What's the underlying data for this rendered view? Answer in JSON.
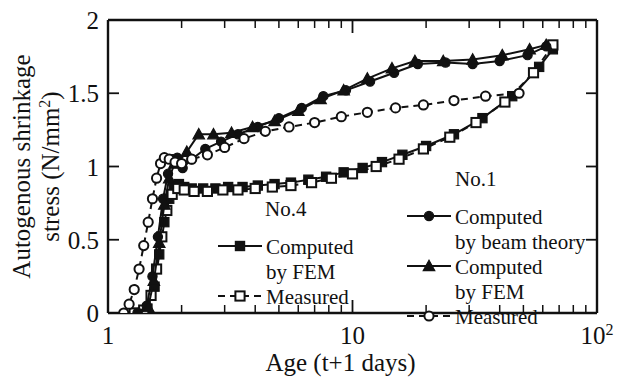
{
  "chart_data": {
    "type": "line",
    "title": "",
    "xlabel": "Age (t+1 days)",
    "ylabel_line1": "Autogenous shrinkage",
    "ylabel_line2": "stress (N/mm",
    "ylabel_sup": "2",
    "ylabel_close": ")",
    "xscale": "log",
    "yscale": "linear",
    "xlim": [
      1,
      100
    ],
    "ylim": [
      0,
      2
    ],
    "xticks": [
      1,
      10,
      100
    ],
    "xticklabels": [
      "1",
      "10",
      "10²"
    ],
    "xtick_superscripts": [
      "",
      "",
      "2"
    ],
    "yticks": [
      0,
      0.5,
      1,
      1.5,
      2
    ],
    "yticklabels": [
      "0",
      "0.5",
      "1",
      "1.5",
      "2"
    ],
    "grid": false,
    "legend_position": "inside-lower-right",
    "series": [
      {
        "name": "No.4 Computed by FEM",
        "group": "No.4",
        "marker": "square-filled",
        "line": "solid",
        "x": [
          1.3,
          1.45,
          1.55,
          1.62,
          1.7,
          1.78,
          1.86,
          1.95,
          2.05,
          2.2,
          2.45,
          2.75,
          3.1,
          3.55,
          4.1,
          4.8,
          5.6,
          6.6,
          7.8,
          9.2,
          11.0,
          13.2,
          16.0,
          20.0,
          26.0,
          34.0,
          45.0,
          58.0,
          66.0
        ],
        "y": [
          0.0,
          0.03,
          0.18,
          0.4,
          0.62,
          0.78,
          0.86,
          0.88,
          0.86,
          0.85,
          0.85,
          0.85,
          0.86,
          0.86,
          0.87,
          0.88,
          0.89,
          0.91,
          0.93,
          0.96,
          0.99,
          1.03,
          1.08,
          1.14,
          1.22,
          1.33,
          1.48,
          1.68,
          1.8
        ]
      },
      {
        "name": "No.4 Measured",
        "group": "No.4",
        "marker": "square-open",
        "line": "dashed",
        "x": [
          1.28,
          1.4,
          1.5,
          1.58,
          1.66,
          1.74,
          1.83,
          1.93,
          2.05,
          2.25,
          2.55,
          2.95,
          3.4,
          4.0,
          4.7,
          5.6,
          6.8,
          8.2,
          10.0,
          12.5,
          15.5,
          19.5,
          25.0,
          32.0,
          42.0,
          55.0,
          66.0
        ],
        "y": [
          0.0,
          0.02,
          0.12,
          0.3,
          0.52,
          0.7,
          0.81,
          0.85,
          0.84,
          0.83,
          0.83,
          0.84,
          0.84,
          0.85,
          0.86,
          0.87,
          0.89,
          0.92,
          0.95,
          1.0,
          1.05,
          1.12,
          1.2,
          1.3,
          1.44,
          1.64,
          1.83
        ]
      },
      {
        "name": "No.1 Computed by beam theory",
        "group": "No.1",
        "marker": "circle-filled",
        "line": "solid",
        "x": [
          1.32,
          1.44,
          1.52,
          1.6,
          1.68,
          1.76,
          1.84,
          1.92,
          2.02,
          2.2,
          2.5,
          2.9,
          3.4,
          4.1,
          5.0,
          6.2,
          7.6,
          9.4,
          11.8,
          14.8,
          18.5,
          24.0,
          31.0,
          40.0,
          52.0,
          62.0
        ],
        "y": [
          0.0,
          0.05,
          0.25,
          0.52,
          0.78,
          0.95,
          1.05,
          1.06,
          0.99,
          1.05,
          1.12,
          1.17,
          1.22,
          1.27,
          1.33,
          1.4,
          1.48,
          1.52,
          1.58,
          1.64,
          1.7,
          1.71,
          1.7,
          1.72,
          1.76,
          1.82
        ]
      },
      {
        "name": "No.1 Computed by FEM",
        "group": "No.1",
        "marker": "triangle-filled",
        "line": "solid",
        "x": [
          1.34,
          1.46,
          1.54,
          1.62,
          1.7,
          1.78,
          1.87,
          1.96,
          2.1,
          2.35,
          2.7,
          3.2,
          3.9,
          4.8,
          6.0,
          7.4,
          9.2,
          11.5,
          14.5,
          18.0,
          23.5,
          31.0,
          41.0,
          53.0,
          62.0
        ],
        "y": [
          0.0,
          0.04,
          0.22,
          0.48,
          0.74,
          0.92,
          1.02,
          1.04,
          1.1,
          1.22,
          1.22,
          1.23,
          1.27,
          1.31,
          1.38,
          1.46,
          1.52,
          1.6,
          1.67,
          1.72,
          1.72,
          1.73,
          1.76,
          1.8,
          1.83
        ]
      },
      {
        "name": "No.1 Measured",
        "group": "No.1",
        "marker": "circle-open",
        "line": "dashed",
        "x": [
          1.16,
          1.22,
          1.28,
          1.34,
          1.4,
          1.46,
          1.52,
          1.58,
          1.64,
          1.7,
          1.78,
          1.88,
          2.0,
          2.2,
          2.55,
          3.0,
          3.6,
          4.4,
          5.5,
          7.0,
          9.0,
          11.5,
          15.0,
          19.5,
          26.0,
          35.0,
          48.0
        ],
        "y": [
          0.0,
          0.06,
          0.16,
          0.3,
          0.46,
          0.62,
          0.78,
          0.92,
          1.02,
          1.06,
          1.05,
          1.03,
          1.02,
          1.05,
          1.08,
          1.13,
          1.19,
          1.24,
          1.27,
          1.3,
          1.34,
          1.37,
          1.4,
          1.42,
          1.45,
          1.48,
          1.5
        ]
      }
    ]
  },
  "legend": {
    "left_group": {
      "title": "No.4",
      "entries": [
        {
          "label_line1": "Computed",
          "label_line2": "by FEM",
          "marker": "square-filled",
          "line": "solid"
        },
        {
          "label_line1": "Measured",
          "label_line2": "",
          "marker": "square-open",
          "line": "dashed"
        }
      ]
    },
    "right_group": {
      "title": "No.1",
      "entries": [
        {
          "label_line1": "Computed",
          "label_line2": "by beam theory",
          "marker": "circle-filled",
          "line": "solid"
        },
        {
          "label_line1": "Computed",
          "label_line2": "by FEM",
          "marker": "triangle-filled",
          "line": "solid"
        },
        {
          "label_line1": "Measured",
          "label_line2": "",
          "marker": "circle-open",
          "line": "dashed"
        }
      ]
    }
  }
}
